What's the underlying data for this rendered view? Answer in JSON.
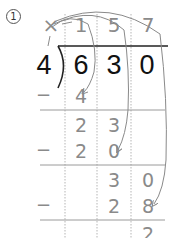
{
  "problem": {
    "number": "1",
    "divisor": "4",
    "dividend": [
      "6",
      "3",
      "0"
    ],
    "quotient_mark": "×",
    "quotient": [
      "1",
      "5",
      "7"
    ],
    "steps": [
      {
        "minus": "−",
        "product": [
          "4",
          "",
          ""
        ]
      },
      {
        "remainder_row": [
          "2",
          "3",
          ""
        ]
      },
      {
        "minus": "−",
        "product": [
          "2",
          "0",
          ""
        ]
      },
      {
        "remainder_row": [
          "",
          "3",
          "0"
        ]
      },
      {
        "minus": "−",
        "product": [
          "",
          "2",
          "8"
        ]
      },
      {
        "remainder_row": [
          "",
          "",
          "2"
        ]
      }
    ],
    "final_remainder": "2"
  },
  "colors": {
    "ink": "#111111",
    "pencil": "#8a8a8a",
    "grid": "#9a9a9a",
    "dotted": "#b0b0b0"
  }
}
